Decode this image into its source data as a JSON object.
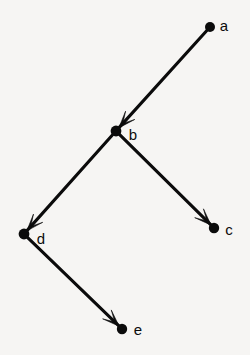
{
  "figure": {
    "kind": "directed-graph",
    "background_color": "#f6f5f3",
    "ink_color": "#0b0b0b",
    "width": 250,
    "height": 355
  },
  "nodes": [
    {
      "id": "a",
      "label": "a",
      "x": 210,
      "y": 27,
      "r": 5.0,
      "label_x": 224,
      "label_y": 27
    },
    {
      "id": "b",
      "label": "b",
      "x": 116,
      "y": 131,
      "r": 5.4,
      "label_x": 133,
      "label_y": 136
    },
    {
      "id": "c",
      "label": "c",
      "x": 214,
      "y": 228,
      "r": 5.2,
      "label_x": 229,
      "label_y": 231
    },
    {
      "id": "d",
      "label": "d",
      "x": 24,
      "y": 234,
      "r": 5.4,
      "label_x": 41,
      "label_y": 240
    },
    {
      "id": "e",
      "label": "e",
      "x": 122,
      "y": 329,
      "r": 5.2,
      "label_x": 138,
      "label_y": 331
    }
  ],
  "edges": [
    {
      "id": "a-b",
      "from": "a",
      "to": "b",
      "directed": true,
      "arrow_at": "b"
    },
    {
      "id": "b-c",
      "from": "b",
      "to": "c",
      "directed": true,
      "arrow_at": "c"
    },
    {
      "id": "b-d",
      "from": "b",
      "to": "d",
      "directed": true,
      "arrow_at": "d"
    },
    {
      "id": "d-e",
      "from": "d",
      "to": "e",
      "directed": true,
      "arrow_at": "e"
    }
  ]
}
